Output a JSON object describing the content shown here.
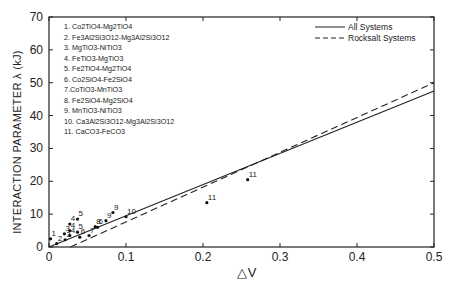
{
  "chart_data": {
    "type": "scatter",
    "title": "",
    "xlabel": "△V",
    "ylabel": "INTERACTION PARAMETER  λ (kJ)",
    "xlim": [
      0,
      0.5
    ],
    "ylim": [
      0,
      70
    ],
    "xticks": [
      "0",
      "0.1",
      "0.2",
      "0.3",
      "0.4",
      "0.5"
    ],
    "yticks": [
      "0",
      "10",
      "20",
      "30",
      "40",
      "50",
      "60",
      "70"
    ],
    "grid": false,
    "legend_position": "upper right",
    "legend": [
      {
        "name": "All Systems",
        "style": "solid"
      },
      {
        "name": "Rocksalt Systems",
        "style": "dashed"
      }
    ],
    "systems": [
      "1. Co2TiO4-Mg2TiO4",
      "2. Fe3Al2Si3O12-Mg3Al2Si3O12",
      "3. MgTiO3-NiTiO3",
      "4. FeTiO3-MgTiO3",
      "5. Fe2TiO4-Mg2TiO4",
      "6. Co2SiO4-Fe2SiO4",
      "7.CoTiO3-MnTiO3",
      "8. Fe2SiO4-Mg2SiO4",
      "9. MnTiO3-NiTiO3",
      "10. Ca3Al2Si3O12-Mg3Al2Si3O12",
      "11. CaCO3-FeCO3"
    ],
    "points": [
      {
        "label": "1",
        "x": 0.002,
        "y": 2.5
      },
      {
        "label": "2",
        "x": 0.01,
        "y": 1.0
      },
      {
        "label": "3",
        "x": 0.02,
        "y": 4.0
      },
      {
        "label": "3",
        "x": 0.021,
        "y": 2.2
      },
      {
        "label": "4",
        "x": 0.027,
        "y": 7.0
      },
      {
        "label": "4",
        "x": 0.027,
        "y": 5.0
      },
      {
        "label": "4",
        "x": 0.027,
        "y": 3.5
      },
      {
        "label": "5",
        "x": 0.037,
        "y": 8.5
      },
      {
        "label": "5",
        "x": 0.037,
        "y": 4.5
      },
      {
        "label": "6",
        "x": 0.04,
        "y": 3.0
      },
      {
        "label": "7",
        "x": 0.052,
        "y": 3.5
      },
      {
        "label": "8",
        "x": 0.06,
        "y": 6.2
      },
      {
        "label": "6",
        "x": 0.063,
        "y": 6.0
      },
      {
        "label": "9",
        "x": 0.074,
        "y": 8.0
      },
      {
        "label": "9",
        "x": 0.083,
        "y": 10.5
      },
      {
        "label": "10",
        "x": 0.1,
        "y": 9.2
      },
      {
        "label": "11",
        "x": 0.205,
        "y": 13.5
      },
      {
        "label": "11",
        "x": 0.258,
        "y": 20.5
      }
    ],
    "series": [
      {
        "name": "All Systems",
        "style": "solid",
        "x": [
          0,
          0.5
        ],
        "y": [
          0,
          47.5
        ]
      },
      {
        "name": "Rocksalt Systems",
        "style": "dashed",
        "x": [
          0.028,
          0.5
        ],
        "y": [
          0,
          50.0
        ]
      }
    ]
  }
}
